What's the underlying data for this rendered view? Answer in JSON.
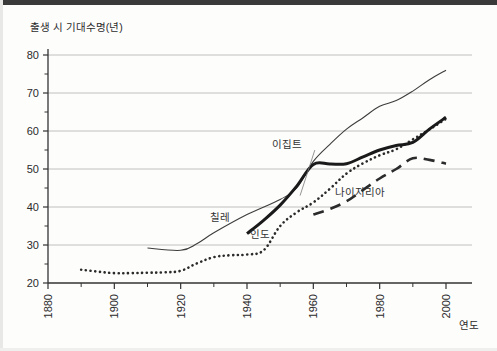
{
  "figure": {
    "background_color": "#fdfdfc",
    "top_band_color": "#3a3a3a"
  },
  "chart_data": {
    "type": "line",
    "title": "",
    "subtitle": "",
    "xlabel": "연도",
    "ylabel": "출생 시 기대수명(년)",
    "xlim": [
      1880,
      2005
    ],
    "ylim": [
      20,
      80
    ],
    "xticks": [
      1880,
      1900,
      1920,
      1940,
      1960,
      1980,
      2000
    ],
    "xtick_labels": [
      "1880",
      "1900",
      "1920",
      "1940",
      "1960",
      "1980",
      "2000"
    ],
    "x_minor_ticks": [
      1890,
      1910,
      1930,
      1950,
      1970,
      1990
    ],
    "yticks": [
      20,
      30,
      40,
      50,
      60,
      70,
      80
    ],
    "ytick_labels": [
      "20",
      "30",
      "40",
      "50",
      "60",
      "70",
      "80"
    ],
    "y_minor_ticks": [
      25,
      35,
      45,
      55,
      65,
      75
    ],
    "grid": "horizontal",
    "grid_color": "#b9b9b9",
    "legend": "inline-annotations",
    "axis_color": "#333333",
    "series": [
      {
        "name": "칠레",
        "label": "칠레",
        "style": "thin-solid",
        "color": "#3d3d3d",
        "width": 1.1,
        "label_x": 1932,
        "label_y": 36.2,
        "x": [
          1910,
          1920,
          1925,
          1930,
          1940,
          1950,
          1955,
          1960,
          1965,
          1970,
          1975,
          1980,
          1985,
          1990,
          1995,
          2000
        ],
        "y": [
          29.2,
          28.6,
          30.4,
          33.2,
          38.0,
          42.0,
          45.0,
          52.0,
          56.5,
          60.5,
          63.5,
          66.5,
          68.0,
          70.5,
          73.5,
          76.0
        ]
      },
      {
        "name": "인도",
        "label": "인도",
        "style": "dotted",
        "color": "#2b2b2b",
        "width": 2.6,
        "label_x": 1944,
        "label_y": 31.8,
        "x": [
          1890,
          1895,
          1900,
          1905,
          1910,
          1915,
          1920,
          1925,
          1930,
          1935,
          1940,
          1945,
          1950,
          1955,
          1960,
          1965,
          1970,
          1975,
          1980,
          1985,
          1990,
          1995,
          2000
        ],
        "y": [
          23.5,
          23.0,
          22.6,
          22.6,
          22.7,
          22.8,
          23.2,
          25.2,
          26.8,
          27.3,
          27.5,
          28.6,
          35.0,
          38.6,
          41.2,
          44.8,
          48.8,
          51.5,
          53.6,
          55.2,
          57.8,
          60.4,
          63.2
        ]
      },
      {
        "name": "이집트",
        "label": "이집트",
        "style": "thick-solid",
        "color": "#1a1a1a",
        "width": 3.0,
        "label_x": 1952,
        "label_y": 55.5,
        "label_leader_to_x": 1956,
        "label_leader_to_y": 43.0,
        "x": [
          1940,
          1945,
          1950,
          1955,
          1960,
          1965,
          1970,
          1975,
          1980,
          1985,
          1990,
          1995,
          2000
        ],
        "y": [
          33.0,
          36.5,
          40.5,
          45.5,
          51.2,
          51.3,
          51.4,
          53.2,
          55.0,
          56.2,
          57.0,
          60.5,
          63.6
        ]
      },
      {
        "name": "나이지리아",
        "label": "나이지리아",
        "style": "dashed",
        "color": "#2b2b2b",
        "width": 2.6,
        "label_x": 1974,
        "label_y": 42.8,
        "x": [
          1960,
          1965,
          1970,
          1975,
          1980,
          1985,
          1990,
          1995,
          2000
        ],
        "y": [
          38.0,
          39.5,
          41.5,
          44.5,
          47.5,
          50.0,
          52.8,
          52.4,
          51.4
        ]
      }
    ]
  }
}
